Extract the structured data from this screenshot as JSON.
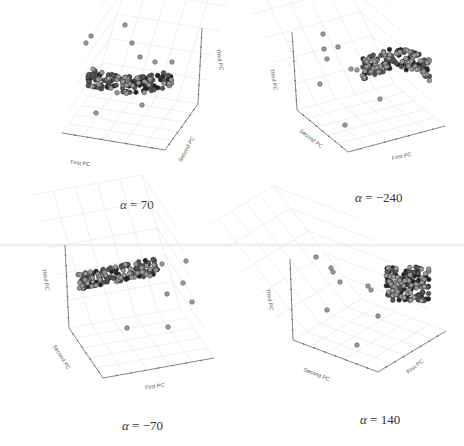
{
  "chart_data": [
    {
      "type": "scatter",
      "projection": "3d",
      "title": "α = 70",
      "alpha_label": "α",
      "alpha_value": "= 70",
      "axis_labels": {
        "x": "First PC",
        "y": "Second PC",
        "z": "Third PC"
      },
      "grid": true,
      "caption_pos": [
        120,
        197
      ],
      "axes": {
        "origin": [
          165,
          150
        ],
        "x_end": [
          62,
          133
        ],
        "y_end": [
          198,
          104
        ],
        "z_end": [
          202,
          28
        ],
        "x_label_pos": [
          80,
          165,
          8
        ],
        "y_label_pos": [
          188,
          150,
          -62
        ],
        "z_label_pos": [
          218,
          60,
          80
        ]
      },
      "cluster": {
        "cx": 130,
        "cy": 77,
        "rx": 42,
        "ry": 9,
        "curve": 8,
        "n": 150,
        "seed": 7
      },
      "outliers": [
        [
          125,
          25
        ],
        [
          91,
          36
        ],
        [
          86,
          43
        ],
        [
          132,
          43
        ],
        [
          96,
          113
        ],
        [
          142,
          105
        ],
        [
          93,
          69
        ],
        [
          172,
          62
        ],
        [
          155,
          62
        ],
        [
          140,
          57
        ]
      ]
    },
    {
      "type": "scatter",
      "projection": "3d",
      "title": "α = −240",
      "alpha_label": "α",
      "alpha_value": "= −240",
      "axis_labels": {
        "x": "First PC",
        "y": "Second PC",
        "z": "Third PC"
      },
      "grid": true,
      "caption_pos": [
        355,
        190
      ],
      "axes": {
        "origin": [
          348,
          152
        ],
        "x_end": [
          445,
          126
        ],
        "y_end": [
          297,
          110
        ],
        "z_end": [
          292,
          32
        ],
        "x_label_pos": [
          402,
          158,
          -12
        ],
        "y_label_pos": [
          310,
          140,
          38
        ],
        "z_label_pos": [
          272,
          80,
          80
        ]
      },
      "cluster": {
        "cx": 396,
        "cy": 70,
        "rx": 34,
        "ry": 11,
        "curve": -10,
        "n": 150,
        "seed": 11
      },
      "outliers": [
        [
          323,
          34
        ],
        [
          324,
          49
        ],
        [
          338,
          47
        ],
        [
          327,
          59
        ],
        [
          320,
          84
        ],
        [
          380,
          99
        ],
        [
          345,
          125
        ],
        [
          351,
          69
        ],
        [
          357,
          70
        ],
        [
          400,
          52
        ]
      ]
    },
    {
      "type": "scatter",
      "projection": "3d",
      "title": "α = −70",
      "alpha_label": "α",
      "alpha_value": "= −70",
      "axis_labels": {
        "x": "First PC",
        "y": "Second PC",
        "z": "Third PC"
      },
      "grid": true,
      "caption_pos": [
        122,
        418
      ],
      "axes": {
        "origin": [
          103,
          378
        ],
        "x_end": [
          214,
          358
        ],
        "y_end": [
          69,
          328
        ],
        "z_end": [
          65,
          245
        ],
        "x_label_pos": [
          155,
          388,
          -8
        ],
        "y_label_pos": [
          60,
          358,
          58
        ],
        "z_label_pos": [
          44,
          280,
          80
        ]
      },
      "cluster": {
        "cx": 118,
        "cy": 274,
        "rx": 40,
        "ry": 8,
        "curve": 0,
        "slope": -0.2,
        "n": 150,
        "seed": 3
      },
      "outliers": [
        [
          162,
          264
        ],
        [
          186,
          261
        ],
        [
          183,
          283
        ],
        [
          167,
          294
        ],
        [
          192,
          302
        ],
        [
          127,
          328
        ],
        [
          168,
          327
        ],
        [
          150,
          276
        ],
        [
          142,
          272
        ]
      ]
    },
    {
      "type": "scatter",
      "projection": "3d",
      "title": "α = 140",
      "alpha_label": "α",
      "alpha_value": "= 140",
      "axis_labels": {
        "x": "First PC",
        "y": "Second PC",
        "z": "Third PC"
      },
      "grid": true,
      "caption_pos": [
        360,
        412
      ],
      "axes": {
        "origin": [
          378,
          372
        ],
        "x_end": [
          446,
          331
        ],
        "y_end": [
          293,
          340
        ],
        "z_end": [
          290,
          259
        ],
        "x_label_pos": [
          416,
          368,
          -38
        ],
        "y_label_pos": [
          316,
          376,
          22
        ],
        "z_label_pos": [
          268,
          300,
          80
        ]
      },
      "cluster": {
        "cx": 407,
        "cy": 284,
        "rx": 22,
        "ry": 17,
        "curve": 0,
        "n": 160,
        "seed": 19
      },
      "outliers": [
        [
          316,
          257
        ],
        [
          331,
          268
        ],
        [
          333,
          272
        ],
        [
          340,
          282
        ],
        [
          327,
          310
        ],
        [
          378,
          316
        ],
        [
          357,
          345
        ],
        [
          368,
          286
        ],
        [
          371,
          290
        ]
      ]
    }
  ]
}
